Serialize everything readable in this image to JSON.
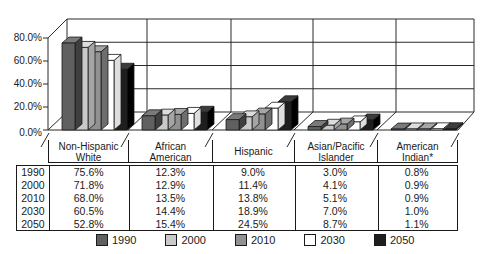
{
  "chart_data": {
    "type": "bar",
    "title": "",
    "subtitle": "",
    "categories": [
      "Non-Hispanic White",
      "African American",
      "Hispanic",
      "Asian/Pacific Islander",
      "American Indian*"
    ],
    "series": [
      {
        "name": "1990",
        "values": [
          75.6,
          12.3,
          9.0,
          3.0,
          0.8
        ],
        "color": "#606060",
        "color_top": "#7a7a7a",
        "color_side": "#3f3f3f"
      },
      {
        "name": "2000",
        "values": [
          71.8,
          12.9,
          11.4,
          4.1,
          0.9
        ],
        "color": "#c9c9c9",
        "color_top": "#dcdcdc",
        "color_side": "#a5a5a5"
      },
      {
        "name": "2010",
        "values": [
          68.0,
          13.5,
          13.8,
          5.1,
          0.9
        ],
        "color": "#919191",
        "color_top": "#a6a6a6",
        "color_side": "#6e6e6e"
      },
      {
        "name": "2030",
        "values": [
          60.5,
          14.4,
          18.9,
          7.0,
          1.0
        ],
        "color": "#ffffff",
        "color_top": "#ffffff",
        "color_side": "#dedede"
      },
      {
        "name": "2050",
        "values": [
          52.8,
          15.4,
          24.5,
          8.7,
          1.1
        ],
        "color": "#1e1e1e",
        "color_top": "#3c3c3c",
        "color_side": "#000000"
      }
    ],
    "ylim": [
      0,
      80
    ],
    "yticks": [
      {
        "label": "80.0%",
        "value": 80
      },
      {
        "label": "60.0%",
        "value": 60
      },
      {
        "label": "40.0%",
        "value": 40
      },
      {
        "label": "20.0%",
        "value": 20
      },
      {
        "label": "0.0%",
        "value": 0
      }
    ],
    "grid": true,
    "legend_position": "bottom",
    "style": "3d-clustered-column"
  },
  "table": {
    "columns": [
      "Non-Hispanic\nWhite",
      "African\nAmerican",
      "Hispanic",
      "Asian/Pacific\nIslander",
      "American\nIndian*"
    ],
    "rows": [
      {
        "year": "1990",
        "values": [
          "75.6%",
          "12.3%",
          "9.0%",
          "3.0%",
          "0.8%"
        ]
      },
      {
        "year": "2000",
        "values": [
          "71.8%",
          "12.9%",
          "11.4%",
          "4.1%",
          "0.9%"
        ]
      },
      {
        "year": "2010",
        "values": [
          "68.0%",
          "13.5%",
          "13.8%",
          "5.1%",
          "0.9%"
        ]
      },
      {
        "year": "2030",
        "values": [
          "60.5%",
          "14.4%",
          "18.9%",
          "7.0%",
          "1.0%"
        ]
      },
      {
        "year": "2050",
        "values": [
          "52.8%",
          "15.4%",
          "24.5%",
          "8.7%",
          "1.1%"
        ]
      }
    ]
  }
}
